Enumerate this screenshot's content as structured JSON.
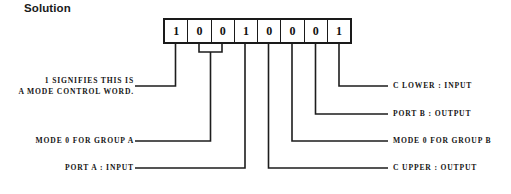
{
  "title": "Solution",
  "control_word": {
    "bits": [
      "1",
      "0",
      "0",
      "1",
      "0",
      "0",
      "0",
      "1"
    ]
  },
  "callouts_left": [
    {
      "id": "mode-control-word",
      "line1": "1 SIGNIFIES THIS IS",
      "line2": "A MODE CONTROL WORD."
    },
    {
      "id": "mode-0-group-a",
      "text": "MODE 0 FOR GROUP A"
    },
    {
      "id": "port-a-input",
      "text": "PORT A : INPUT"
    }
  ],
  "callouts_right": [
    {
      "id": "c-lower-input",
      "text": "C LOWER : INPUT"
    },
    {
      "id": "port-b-output",
      "text": "PORT B : OUTPUT"
    },
    {
      "id": "mode-0-group-b",
      "text": "MODE 0 FOR GROUP B"
    },
    {
      "id": "c-upper-output",
      "text": "C UPPER : OUTPUT"
    }
  ],
  "colors": {
    "ink": "#1a1a1a",
    "background": "#ffffff"
  }
}
